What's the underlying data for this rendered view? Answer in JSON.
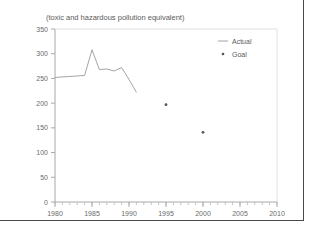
{
  "chart_data": {
    "type": "line",
    "title": "(toxic and hazardous pollution equivalent)",
    "xlabel": "",
    "ylabel": "",
    "xlim": [
      1980,
      2010
    ],
    "ylim": [
      0,
      350
    ],
    "xticks": [
      1980,
      1985,
      1990,
      1995,
      2000,
      2005,
      2010
    ],
    "yticks": [
      0,
      50,
      100,
      150,
      200,
      250,
      300,
      350
    ],
    "minor_x_tick_step": 1,
    "grid": false,
    "legend_position": "top-right",
    "series": [
      {
        "name": "Actual",
        "marker": "line",
        "color": "#9a9a9a",
        "x": [
          1980,
          1981,
          1982,
          1983,
          1984,
          1985,
          1986,
          1987,
          1988,
          1989,
          1990,
          1991
        ],
        "values": [
          252,
          253,
          254,
          255,
          256,
          308,
          268,
          269,
          265,
          272,
          248,
          222
        ]
      },
      {
        "name": "Goal",
        "marker": "dot",
        "color": "#555555",
        "x": [
          1995,
          2000
        ],
        "values": [
          197,
          141
        ]
      }
    ]
  },
  "legend": {
    "items": [
      {
        "label": "Actual",
        "glyph": "line-swatch"
      },
      {
        "label": "Goal",
        "glyph": "dot-swatch"
      }
    ]
  },
  "axes": {
    "y_tick_labels": [
      "350",
      "300",
      "250",
      "200",
      "150",
      "100",
      "50",
      "0"
    ],
    "x_tick_labels": [
      "1980",
      "1985",
      "1990",
      "1995",
      "2000",
      "2005",
      "2010"
    ]
  }
}
